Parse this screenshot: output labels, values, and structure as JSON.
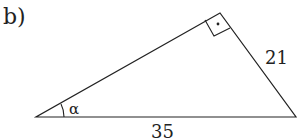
{
  "part_label": "b)",
  "triangle": {
    "type": "right-triangle",
    "vertices": {
      "left": [
        36,
        117
      ],
      "right": [
        297,
        117
      ],
      "right_angle_vertex": [
        220,
        13
      ]
    },
    "side_labels": {
      "hypotenuse": "35",
      "leg_right": "21"
    },
    "angle_label": "α",
    "right_angle_marker": true,
    "colors": {
      "stroke": "#222222",
      "text": "#222222"
    }
  }
}
